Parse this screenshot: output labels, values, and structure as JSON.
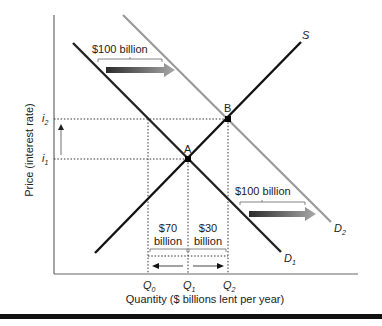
{
  "diagram": {
    "axes": {
      "ylabel": "Price (interest rate)",
      "xlabel": "Quantity ($ billions lent per year)",
      "y_ticks": [
        {
          "base": "i",
          "sub": "2"
        },
        {
          "base": "i",
          "sub": "1"
        }
      ],
      "x_ticks": [
        {
          "base": "Q",
          "sub": "0"
        },
        {
          "base": "Q",
          "sub": "1"
        },
        {
          "base": "Q",
          "sub": "2"
        }
      ]
    },
    "curves": {
      "supply": {
        "label": "S",
        "color": "#111111"
      },
      "demand1": {
        "label_base": "D",
        "label_sub": "1",
        "color": "#222222"
      },
      "demand2": {
        "label_base": "D",
        "label_sub": "2",
        "color": "#9a9a9a"
      }
    },
    "points": {
      "a": "A",
      "b": "B"
    },
    "annotations": {
      "shift_top": "$100 billion",
      "shift_bottom": "$100 billion",
      "left_amount": "$70",
      "left_unit": "billion",
      "right_amount": "$30",
      "right_unit": "billion"
    },
    "colors": {
      "arrow_dark": "#2b2b2b",
      "arrow_light": "#9a9a9a",
      "axis": "#555555"
    }
  }
}
